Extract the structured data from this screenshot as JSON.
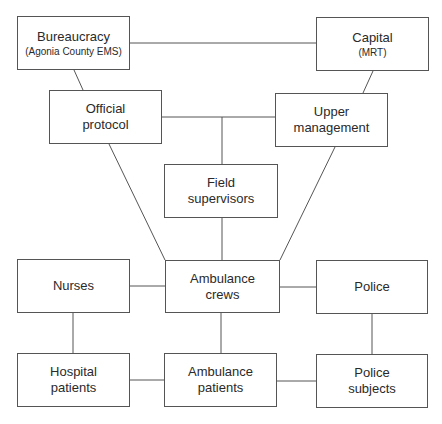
{
  "diagram": {
    "nodes": [
      {
        "id": "bureaucracy",
        "label": "Bureaucracy",
        "sublabel": "(Agonia County EMS)"
      },
      {
        "id": "capital",
        "label": "Capital",
        "sublabel": "(MRT)"
      },
      {
        "id": "official-protocol",
        "label": "Official protocol"
      },
      {
        "id": "upper-management",
        "label": "Upper management"
      },
      {
        "id": "field-supervisors",
        "label": "Field supervisors"
      },
      {
        "id": "nurses",
        "label": "Nurses"
      },
      {
        "id": "ambulance-crews",
        "label": "Ambulance crews"
      },
      {
        "id": "police",
        "label": "Police"
      },
      {
        "id": "hospital-patients",
        "label": "Hospital patients"
      },
      {
        "id": "ambulance-patients",
        "label": "Ambulance patients"
      },
      {
        "id": "police-subjects",
        "label": "Police subjects"
      }
    ],
    "edges": [
      [
        "bureaucracy",
        "capital"
      ],
      [
        "bureaucracy",
        "official-protocol"
      ],
      [
        "capital",
        "upper-management"
      ],
      [
        "official-protocol",
        "upper-management"
      ],
      [
        "official-protocol",
        "ambulance-crews"
      ],
      [
        "upper-management",
        "ambulance-crews"
      ],
      [
        "field-supervisors",
        "ambulance-crews"
      ],
      [
        "nurses",
        "ambulance-crews"
      ],
      [
        "ambulance-crews",
        "police"
      ],
      [
        "ambulance-crews",
        "ambulance-patients"
      ],
      [
        "nurses",
        "hospital-patients"
      ],
      [
        "police",
        "police-subjects"
      ],
      [
        "hospital-patients",
        "ambulance-patients"
      ],
      [
        "ambulance-patients",
        "police-subjects"
      ]
    ]
  }
}
